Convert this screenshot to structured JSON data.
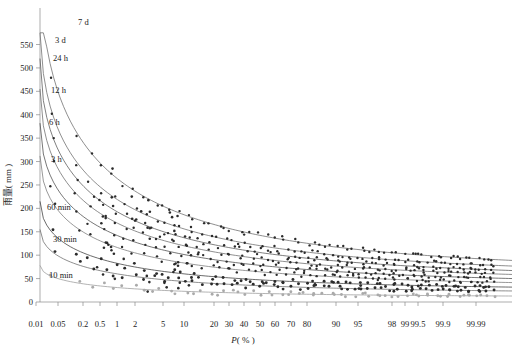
{
  "chart_data": {
    "type": "line",
    "title": "",
    "xlabel": "P( % )",
    "ylabel": "雨量( mm )",
    "xscale": "probability",
    "grid": false,
    "legend_position": "inline-curve-labels",
    "x_ticks": [
      {
        "label": "0.01",
        "pos": 36
      },
      {
        "label": "0.05",
        "pos": 58
      },
      {
        "label": "0.2",
        "pos": 83
      },
      {
        "label": "0.5",
        "pos": 100
      },
      {
        "label": "1",
        "pos": 117
      },
      {
        "label": "2",
        "pos": 135
      },
      {
        "label": "5",
        "pos": 163
      },
      {
        "label": "10",
        "pos": 184
      },
      {
        "label": "20",
        "pos": 214
      },
      {
        "label": "30",
        "pos": 229
      },
      {
        "label": "40",
        "pos": 244
      },
      {
        "label": "50",
        "pos": 260
      },
      {
        "label": "60",
        "pos": 275
      },
      {
        "label": "70",
        "pos": 291
      },
      {
        "label": "80",
        "pos": 307
      },
      {
        "label": "90",
        "pos": 336
      },
      {
        "label": "95",
        "pos": 358
      },
      {
        "label": "98",
        "pos": 392
      },
      {
        "label": "99",
        "pos": 405
      },
      {
        "label": "99.5",
        "pos": 418
      },
      {
        "label": "99.9",
        "pos": 443
      },
      {
        "label": "99.99",
        "pos": 476
      }
    ],
    "y_ticks": [
      "0",
      "50",
      "100",
      "150",
      "200",
      "250",
      "300",
      "350",
      "400",
      "450",
      "500",
      "550"
    ],
    "ylim": [
      0,
      575
    ],
    "series": [
      {
        "name": "7 d",
        "label_x": 78,
        "label_y": 25,
        "y_left": 720,
        "y_right": 62,
        "color": "#6a6a6a"
      },
      {
        "name": "3 d",
        "label_x": 55,
        "label_y": 43,
        "y_left": 590,
        "y_right": 55,
        "color": "#6a6a6a"
      },
      {
        "name": "24 h",
        "label_x": 53,
        "label_y": 61,
        "y_left": 520,
        "y_right": 48,
        "color": "#555555"
      },
      {
        "name": "12 h",
        "label_x": 51,
        "label_y": 93,
        "y_left": 455,
        "y_right": 42,
        "color": "#6a6a6a"
      },
      {
        "name": "6 h",
        "label_x": 49,
        "label_y": 125,
        "y_left": 382,
        "y_right": 36,
        "color": "#4a4a4a"
      },
      {
        "name": "3 h",
        "label_x": 51,
        "label_y": 162,
        "y_left": 312,
        "y_right": 30,
        "color": "#777777"
      },
      {
        "name": "60 min",
        "label_x": 47,
        "label_y": 210,
        "y_left": 215,
        "y_right": 24,
        "color": "#3a3a3a"
      },
      {
        "name": "30 min",
        "label_x": 53,
        "label_y": 242,
        "y_left": 155,
        "y_right": 18,
        "color": "#6a6a6a"
      },
      {
        "name": "10 min",
        "label_x": 49,
        "label_y": 278,
        "y_left": 78,
        "y_right": 10,
        "color": "#9a9a9a"
      }
    ],
    "scatter_note": "observed sample points plotted along each frequency curve"
  },
  "figure": {
    "y_axis_label": "雨量( mm )",
    "x_axis_label_italic": "P",
    "x_axis_label_rest": "( % )"
  }
}
